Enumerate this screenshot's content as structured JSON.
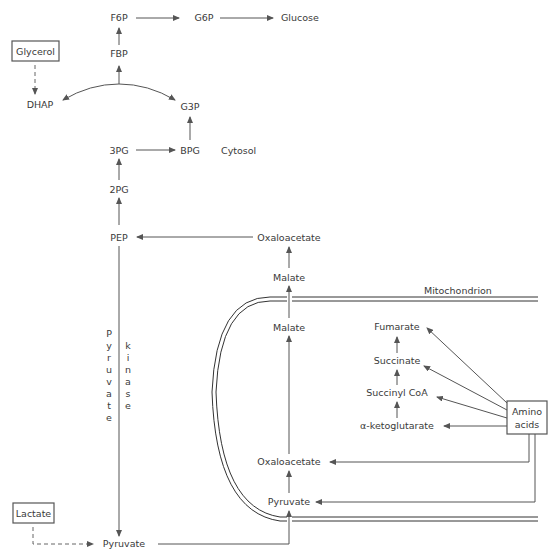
{
  "diagram": {
    "compartments": {
      "cytosol": "Cytosol",
      "mitochondrion": "Mitochondrion"
    },
    "metabolites": {
      "f6p": "F6P",
      "g6p": "G6P",
      "glucose": "Glucose",
      "fbp": "FBP",
      "dhap": "DHAP",
      "g3p": "G3P",
      "pg3": "3PG",
      "bpg": "BPG",
      "pg2": "2PG",
      "pep": "PEP",
      "oaa_cyto": "Oxaloacetate",
      "malate_cyto": "Malate",
      "malate_mito": "Malate",
      "fumarate": "Fumarate",
      "succinate": "Succinate",
      "succinyl_coa": "Succinyl CoA",
      "akg": "α-ketoglutarate",
      "oaa_mito": "Oxaloacetate",
      "pyruvate_mito": "Pyruvate",
      "pyruvate_cyto": "Pyruvate"
    },
    "sources": {
      "glycerol": "Glycerol",
      "lactate": "Lactate",
      "amino_acids_1": "Amino",
      "amino_acids_2": "acids"
    },
    "enzyme": {
      "word1": [
        "P",
        "y",
        "r",
        "u",
        "v",
        "a",
        "t",
        "e"
      ],
      "word2": [
        "k",
        "i",
        "n",
        "a",
        "s",
        "e"
      ]
    }
  }
}
